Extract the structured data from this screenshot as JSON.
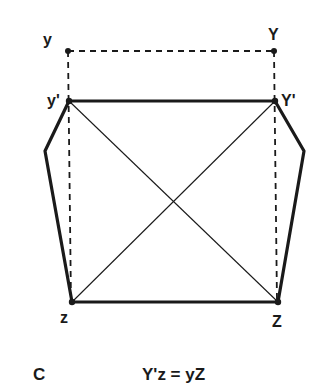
{
  "figure": {
    "panel_label": "C",
    "equation": "Y'z = yZ",
    "colors": {
      "ink": "#1a1a1a",
      "background": "#ffffff"
    },
    "points": {
      "y": {
        "label": "y",
        "x": 68,
        "y": 51
      },
      "Y": {
        "label": "Y",
        "x": 274,
        "y": 51
      },
      "y_prime": {
        "label": "y'",
        "x": 69,
        "y": 101
      },
      "Y_prime": {
        "label": "Y'",
        "x": 275,
        "y": 101
      },
      "left_mid": {
        "label": "",
        "x": 45,
        "y": 151
      },
      "right_mid": {
        "label": "",
        "x": 304,
        "y": 151
      },
      "z": {
        "label": "z",
        "x": 72,
        "y": 302
      },
      "Z": {
        "label": "Z",
        "x": 278,
        "y": 302
      }
    },
    "segments": {
      "dashed": [
        [
          "y",
          "Y"
        ],
        [
          "y",
          "z"
        ],
        [
          "Y",
          "Z"
        ]
      ],
      "thick": [
        [
          "y_prime",
          "Y_prime"
        ],
        [
          "z",
          "Z"
        ],
        [
          "y_prime",
          "left_mid"
        ],
        [
          "left_mid",
          "z"
        ],
        [
          "Y_prime",
          "right_mid"
        ],
        [
          "right_mid",
          "Z"
        ]
      ],
      "thin": [
        [
          "y_prime",
          "Z"
        ],
        [
          "Y_prime",
          "z"
        ]
      ]
    }
  }
}
